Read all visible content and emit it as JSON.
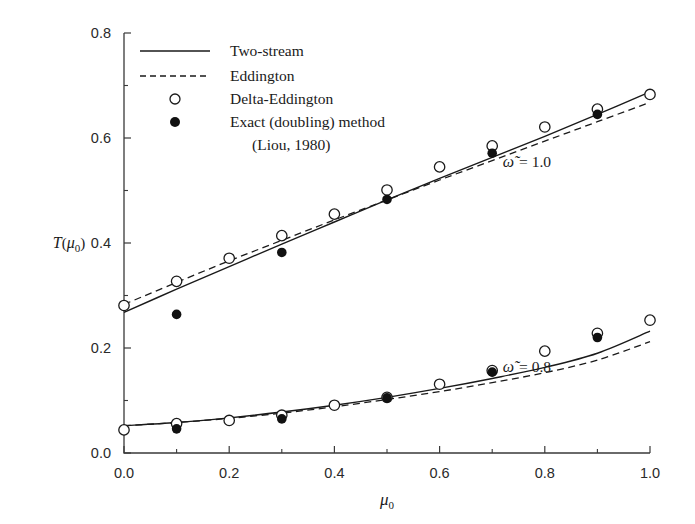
{
  "chart_data": {
    "type": "scatter",
    "title": "",
    "xlabel": "μ₀",
    "ylabel": "T(μ₀)",
    "xlim": [
      0.0,
      1.0
    ],
    "ylim": [
      0.0,
      0.8
    ],
    "xticks": [
      0.0,
      0.2,
      0.4,
      0.6,
      0.8,
      1.0
    ],
    "xticklabels": [
      "0.0",
      "0.2",
      "0.4",
      "0.6",
      "0.8",
      "1.0"
    ],
    "xminorticks": [
      0.1,
      0.3,
      0.5,
      0.7,
      0.9
    ],
    "yticks": [
      0.0,
      0.2,
      0.4,
      0.6,
      0.8
    ],
    "yticklabels": [
      "0.0",
      "0.2",
      "0.4",
      "0.6",
      "0.8"
    ],
    "yminorticks": [
      0.1,
      0.3,
      0.5,
      0.7
    ],
    "grid": false,
    "legend_position": "top-left",
    "legend": [
      {
        "label": "Two-stream",
        "marker": "solid-line"
      },
      {
        "label": "Eddington",
        "marker": "dashed-line"
      },
      {
        "label": "Delta-Eddington",
        "marker": "open-circle"
      },
      {
        "label": "Exact (doubling) method",
        "marker": "filled-circle"
      },
      {
        "label": "(Liou, 1980)",
        "marker": "none"
      }
    ],
    "annotations": [
      {
        "text": "ω̃ = 1.0",
        "x": 0.72,
        "y": 0.545
      },
      {
        "text": "ω̃ = 0.8",
        "x": 0.72,
        "y": 0.155
      }
    ],
    "groups": [
      {
        "name": "omega_tilde_1.0",
        "annotation": "ω̃ = 1.0",
        "series": [
          {
            "name": "Two-stream",
            "style": "solid",
            "x": [
              0.0,
              0.1,
              0.2,
              0.3,
              0.4,
              0.5,
              0.6,
              0.7,
              0.8,
              0.9,
              1.0
            ],
            "y": [
              0.268,
              0.312,
              0.355,
              0.398,
              0.44,
              0.482,
              0.523,
              0.563,
              0.603,
              0.645,
              0.688
            ]
          },
          {
            "name": "Eddington",
            "style": "dashed",
            "x": [
              0.0,
              0.1,
              0.2,
              0.3,
              0.4,
              0.5,
              0.6,
              0.7,
              0.8,
              0.9,
              1.0
            ],
            "y": [
              0.283,
              0.325,
              0.366,
              0.405,
              0.444,
              0.482,
              0.52,
              0.557,
              0.594,
              0.631,
              0.668
            ]
          },
          {
            "name": "Delta-Eddington",
            "style": "open-circle",
            "x": [
              0.0,
              0.1,
              0.2,
              0.3,
              0.4,
              0.5,
              0.6,
              0.7,
              0.8,
              0.9,
              1.0
            ],
            "y": [
              0.281,
              0.327,
              0.371,
              0.414,
              0.455,
              0.501,
              0.545,
              0.585,
              0.621,
              0.655,
              0.683
            ]
          },
          {
            "name": "Exact (doubling) method",
            "style": "filled-circle",
            "x": [
              0.1,
              0.3,
              0.5,
              0.7,
              0.9
            ],
            "y": [
              0.264,
              0.382,
              0.483,
              0.571,
              0.645
            ]
          }
        ]
      },
      {
        "name": "omega_tilde_0.8",
        "annotation": "ω̃ = 0.8",
        "series": [
          {
            "name": "Two-stream",
            "style": "solid",
            "x": [
              0.0,
              0.1,
              0.2,
              0.3,
              0.4,
              0.5,
              0.6,
              0.7,
              0.8,
              0.9,
              1.0
            ],
            "y": [
              0.052,
              0.058,
              0.067,
              0.078,
              0.091,
              0.106,
              0.123,
              0.142,
              0.163,
              0.19,
              0.232
            ]
          },
          {
            "name": "Eddington",
            "style": "dashed",
            "x": [
              0.0,
              0.1,
              0.2,
              0.3,
              0.4,
              0.5,
              0.6,
              0.7,
              0.8,
              0.9,
              1.0
            ],
            "y": [
              0.052,
              0.058,
              0.066,
              0.076,
              0.088,
              0.102,
              0.117,
              0.134,
              0.153,
              0.177,
              0.212
            ]
          },
          {
            "name": "Delta-Eddington",
            "style": "open-circle",
            "x": [
              0.0,
              0.1,
              0.2,
              0.3,
              0.4,
              0.5,
              0.6,
              0.7,
              0.8,
              0.9,
              1.0
            ],
            "y": [
              0.044,
              0.056,
              0.062,
              0.072,
              0.091,
              0.106,
              0.131,
              0.157,
              0.194,
              0.228,
              0.253
            ]
          },
          {
            "name": "Exact (doubling) method",
            "style": "filled-circle",
            "x": [
              0.1,
              0.3,
              0.5,
              0.7,
              0.9
            ],
            "y": [
              0.046,
              0.065,
              0.105,
              0.154,
              0.22
            ]
          }
        ]
      }
    ]
  },
  "figure": {
    "background_color": "#ffffff",
    "line_color": "#1a1a1a",
    "marker_open_fill": "#ffffff",
    "marker_filled_fill": "#111111"
  }
}
